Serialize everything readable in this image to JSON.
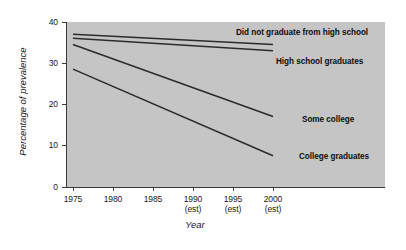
{
  "chart_data": {
    "type": "line",
    "title": "",
    "xlabel": "Year",
    "ylabel": "Percentage of prevalence",
    "xlim": [
      1975,
      2000
    ],
    "ylim": [
      0,
      40
    ],
    "grid": false,
    "legend_position": "inline-right-of-line-ends",
    "x": [
      1975,
      2000
    ],
    "xticks": [
      {
        "value": 1975,
        "label": "1975",
        "sub": ""
      },
      {
        "value": 1980,
        "label": "1980",
        "sub": ""
      },
      {
        "value": 1985,
        "label": "1985",
        "sub": ""
      },
      {
        "value": 1990,
        "label": "1990",
        "sub": "(est)"
      },
      {
        "value": 1995,
        "label": "1995",
        "sub": "(est)"
      },
      {
        "value": 2000,
        "label": "2000",
        "sub": "(est)"
      }
    ],
    "yticks": [
      {
        "value": 0,
        "label": "0"
      },
      {
        "value": 10,
        "label": "10"
      },
      {
        "value": 20,
        "label": "20"
      },
      {
        "value": 30,
        "label": "30"
      },
      {
        "value": 40,
        "label": "40"
      }
    ],
    "series": [
      {
        "name": "Did not graduate from high school",
        "values": [
          37.0,
          34.5
        ],
        "color": "#2b2b2b"
      },
      {
        "name": "High school graduates",
        "values": [
          36.0,
          33.0
        ],
        "color": "#2b2b2b"
      },
      {
        "name": "Some college",
        "values": [
          34.5,
          17.0
        ],
        "color": "#2b2b2b"
      },
      {
        "name": "College graduates",
        "values": [
          28.5,
          7.5
        ],
        "color": "#2b2b2b"
      }
    ]
  },
  "style": {
    "plot_background": "#c5c5c5",
    "page_background": "#ffffff",
    "axis_color": "#3a3a3a",
    "line_color": "#2b2b2b",
    "text_color": "#1a1a1a"
  }
}
